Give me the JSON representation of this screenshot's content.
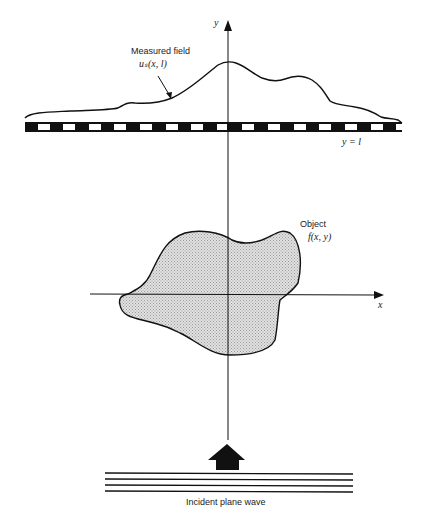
{
  "diagram": {
    "type": "diffraction tomography setup",
    "labels": {
      "measured_field": "Measured field",
      "measured_field_symbol": "uₛ(x, l)",
      "detector_line": "y = l",
      "y_axis": "y",
      "x_axis": "x",
      "object": "Object",
      "object_symbol": "f(x, y)",
      "incident_wave": "Incident plane wave"
    },
    "elements": [
      {
        "name": "y-axis",
        "kind": "arrow",
        "direction": "up"
      },
      {
        "name": "x-axis",
        "kind": "arrow",
        "direction": "right"
      },
      {
        "name": "detector-line",
        "kind": "checkered bar",
        "position": "y = l"
      },
      {
        "name": "measured-field-curve",
        "kind": "curve",
        "peak": "near y-axis"
      },
      {
        "name": "object",
        "kind": "shaded blob",
        "centered_on": "origin"
      },
      {
        "name": "propagation-arrow",
        "kind": "block arrow",
        "direction": "up"
      },
      {
        "name": "plane-wave",
        "kind": "parallel lines",
        "count": 4
      }
    ],
    "colors": {
      "ink": "#111111",
      "object_fill": "#d4d4d4",
      "background": "#ffffff"
    }
  }
}
